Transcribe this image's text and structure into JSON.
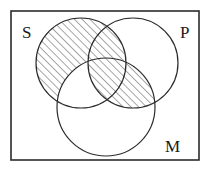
{
  "figure": {
    "kind": "venn-diagram",
    "background_color": "#ffffff",
    "stroke_color": "#2b2b2b",
    "hatch_color": "#3a3a3a"
  },
  "frame": {
    "name": "universe-rectangle",
    "x": 11,
    "y": 11,
    "width": 188,
    "height": 149,
    "stroke_width": 1.6
  },
  "circles": [
    {
      "id": "S",
      "label": "S",
      "cx": 81,
      "cy": 63,
      "r": 45,
      "label_x": 22,
      "label_y": 38
    },
    {
      "id": "P",
      "label": "P",
      "cx": 133,
      "cy": 63,
      "r": 45,
      "label_x": 180,
      "label_y": 38
    },
    {
      "id": "M",
      "label": "M",
      "cx": 106,
      "cy": 107,
      "r": 49,
      "label_x": 165,
      "label_y": 152
    }
  ],
  "shaded_regions": [
    {
      "id": "S-minus-M",
      "description": "region of S outside M",
      "pattern": "diagonal-hatch"
    },
    {
      "id": "P-and-M",
      "description": "intersection of P and M",
      "pattern": "diagonal-hatch"
    }
  ],
  "hatch": {
    "angle_degrees": 45,
    "spacing": 5.5,
    "line_width": 0.9
  }
}
